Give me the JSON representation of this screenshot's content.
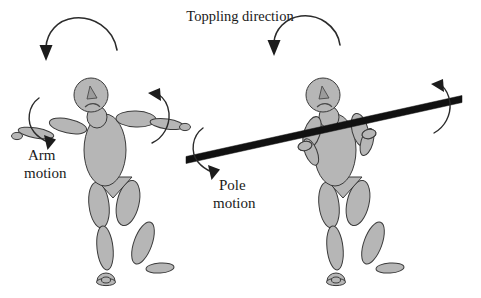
{
  "figure": {
    "title": "Toppling direction",
    "domain": "diagram",
    "background_color": "#ffffff",
    "body_fill_color": "#b6b6b6",
    "body_stroke_color": "#3a3a3a",
    "pole_color": "#111111",
    "arrow_color": "#1c1c1c",
    "text_color": "#1a1a1a"
  },
  "labels": {
    "title": "Toppling direction",
    "left_annotation_line1": "Arm",
    "left_annotation_line2": "motion",
    "right_annotation_line1": "Pole",
    "right_annotation_line2": "motion"
  },
  "panels": [
    {
      "id": "left-panel",
      "name": "arm-motion-figure",
      "description": "Stick figure with both arms outstretched horizontally",
      "annotation": "Arm motion",
      "has_pole": false,
      "toppling_arrow": "arc-left-down"
    },
    {
      "id": "right-panel",
      "name": "pole-motion-figure",
      "description": "Stick figure holding a long tilted pole with both hands",
      "annotation": "Pole motion",
      "has_pole": true,
      "toppling_arrow": "arc-left-down"
    }
  ],
  "arrows": [
    {
      "name": "toppling-arrow-left",
      "type": "arc",
      "direction": "clockwise-to-down-left"
    },
    {
      "name": "toppling-arrow-right",
      "type": "arc",
      "direction": "clockwise-to-down-left"
    },
    {
      "name": "arm-motion-arrow-left",
      "type": "curve",
      "direction": "down-right"
    },
    {
      "name": "arm-motion-arrow-right",
      "type": "curve",
      "direction": "up-left"
    },
    {
      "name": "pole-motion-arrow-left",
      "type": "curve",
      "direction": "down-right"
    },
    {
      "name": "pole-motion-arrow-right",
      "type": "curve",
      "direction": "up-left"
    }
  ],
  "pole": {
    "name": "balance-pole",
    "start": {
      "x": 186,
      "y": 160
    },
    "end": {
      "x": 462,
      "y": 99
    },
    "thickness": 7
  }
}
